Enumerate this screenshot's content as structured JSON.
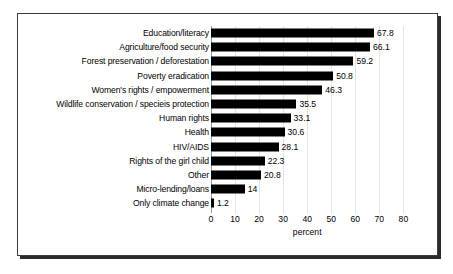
{
  "chart_data": {
    "type": "bar",
    "orientation": "horizontal",
    "title": "",
    "xlabel": "percent",
    "ylabel": "",
    "xlim": [
      0,
      80
    ],
    "xticks": [
      0,
      10,
      20,
      30,
      40,
      50,
      60,
      70,
      80
    ],
    "grid": true,
    "legend": "none",
    "bar_color": "#000000",
    "categories": [
      "Education/literacy",
      "Agriculture/food security",
      "Forest preservation / deforestation",
      "Poverty eradication",
      "Women's rights / empowerment",
      "Wildlife conservation / specieis protection",
      "Human rights",
      "Health",
      "HIV/AIDS",
      "Rights of the girl child",
      "Other",
      "Micro-lending/loans",
      "Only climate change"
    ],
    "values": [
      67.8,
      66.1,
      59.2,
      50.8,
      46.3,
      35.5,
      33.1,
      30.6,
      28.1,
      22.3,
      20.8,
      14,
      1.2
    ],
    "value_labels": [
      "67.8",
      "66.1",
      "59.2",
      "50.8",
      "46.3",
      "35.5",
      "33.1",
      "30.6",
      "28.1",
      "22.3",
      "20.8",
      "14",
      "1.2"
    ]
  }
}
